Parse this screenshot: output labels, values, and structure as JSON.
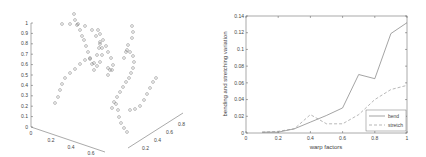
{
  "chart_data": [
    {
      "type": "scatter",
      "subtype": "3d-scatter",
      "title": "",
      "xlabel": "",
      "ylabel": "",
      "zlabel": "",
      "x_ticks": [
        "0",
        "0.2",
        "0.4",
        "0.6"
      ],
      "y_ticks": [
        "0.2",
        "0.4",
        "0.6",
        "0.8"
      ],
      "z_ticks": [
        "0",
        "0.1",
        "0.2",
        "0.3",
        "0.4",
        "0.5",
        "0.6",
        "0.7",
        "0.8",
        "0.9",
        "1"
      ],
      "zlim": [
        0,
        1
      ],
      "marker": "open-circle",
      "description": "Open-circle markers forming several curved strands (point trajectories) rising through 3D space"
    },
    {
      "type": "line",
      "title": "",
      "xlabel": "warp factors",
      "ylabel": "bending and stretching variation",
      "xlim": [
        0,
        1
      ],
      "ylim": [
        0,
        0.14
      ],
      "x_ticks": [
        "0",
        "0.2",
        "0.4",
        "0.6",
        "0.8",
        "1"
      ],
      "y_ticks": [
        "0",
        "0.02",
        "0.04",
        "0.06",
        "0.08",
        "0.1",
        "0.12",
        "0.14"
      ],
      "grid": false,
      "legend_position": "lower right",
      "x": [
        0.1,
        0.2,
        0.3,
        0.4,
        0.5,
        0.6,
        0.7,
        0.8,
        0.9,
        1.0
      ],
      "series": [
        {
          "name": "bend",
          "style": "solid",
          "values": [
            0.001,
            0.001,
            0.005,
            0.013,
            0.021,
            0.03,
            0.07,
            0.065,
            0.119,
            0.132
          ]
        },
        {
          "name": "stretch",
          "style": "dashed",
          "values": [
            0.001,
            0.002,
            0.005,
            0.022,
            0.011,
            0.011,
            0.022,
            0.04,
            0.052,
            0.057
          ]
        }
      ]
    }
  ],
  "left_plot": {
    "z_ticks": [
      "0",
      "0.1",
      "0.2",
      "0.3",
      "0.4",
      "0.5",
      "0.6",
      "0.7",
      "0.8",
      "0.9",
      "1"
    ],
    "x_ticks": [
      "0",
      "0.2",
      "0.4",
      "0.6"
    ],
    "y_ticks": [
      "0.2",
      "0.4",
      "0.6",
      "0.8"
    ]
  },
  "right_plot": {
    "xlabel": "warp factors",
    "ylabel": "bending and stretching variation",
    "x_ticks": [
      "0",
      "0.2",
      "0.4",
      "0.6",
      "0.8",
      "1"
    ],
    "y_ticks": [
      "0",
      "0.02",
      "0.04",
      "0.06",
      "0.08",
      "0.1",
      "0.12",
      "0.14"
    ],
    "legend": [
      "bend",
      "stretch"
    ]
  }
}
